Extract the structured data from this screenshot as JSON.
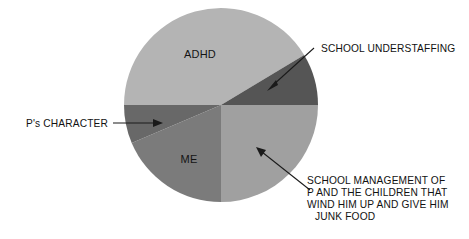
{
  "page": {
    "background_color": "#ffffff",
    "width": 469,
    "height": 239
  },
  "chart_data": {
    "type": "pie",
    "title": "",
    "subtitle": "",
    "xlabel": "",
    "ylabel": "",
    "legend_position": "none",
    "grid": false,
    "labels_placement": "inside-and-callout",
    "center": {
      "x": 221,
      "y": 105
    },
    "radius": 97,
    "start_angle_deg": 270,
    "direction": "clockwise",
    "categories": [
      "ADHD",
      "SCHOOL UNDERSTAFFING",
      "SCHOOL MANAGEMENT OF P AND THE CHILDREN THAT WIND HIM UP AND GIVE HIM JUNK FOOD",
      "ME",
      "P's CHARACTER"
    ],
    "values": [
      149,
      31,
      90,
      67,
      23
    ],
    "units": "degrees",
    "percentages": [
      41.4,
      8.6,
      25.0,
      18.6,
      6.4
    ],
    "colors": [
      "#b4b4b4",
      "#555555",
      "#a0a0a0",
      "#7b7b7b",
      "#686868"
    ],
    "slices": [
      {
        "label": "ADHD",
        "value": 149,
        "percent": 41.4,
        "color": "#b4b4b4",
        "start_deg": 270,
        "end_deg": 59,
        "label_type": "inside"
      },
      {
        "label": "SCHOOL UNDERSTAFFING",
        "value": 31,
        "percent": 8.6,
        "color": "#555555",
        "start_deg": 59,
        "end_deg": 90,
        "label_type": "callout"
      },
      {
        "label": "SCHOOL MANAGEMENT OF P AND THE CHILDREN THAT WIND HIM UP AND GIVE HIM JUNK FOOD",
        "value": 90,
        "percent": 25.0,
        "color": "#a0a0a0",
        "start_deg": 90,
        "end_deg": 180,
        "label_type": "callout"
      },
      {
        "label": "ME",
        "value": 67,
        "percent": 18.6,
        "color": "#7b7b7b",
        "start_deg": 180,
        "end_deg": 247,
        "label_type": "inside"
      },
      {
        "label": "P's CHARACTER",
        "value": 23,
        "percent": 6.4,
        "color": "#686868",
        "start_deg": 247,
        "end_deg": 270,
        "label_type": "callout"
      }
    ]
  },
  "inside_labels": {
    "adhd": "ADHD",
    "me": "ME"
  },
  "callouts": {
    "school_understaffing": {
      "text": "SCHOOL UNDERSTAFFING"
    },
    "ps_character": {
      "text": "P's CHARACTER"
    },
    "school_management": {
      "line1": "SCHOOL MANAGEMENT OF",
      "line2": "P AND THE CHILDREN THAT",
      "line3": "WIND HIM UP AND GIVE HIM",
      "line4": "JUNK FOOD"
    }
  },
  "colors": {
    "text": "#121212",
    "leader_line": "#1a1a1a",
    "slice_adhd": "#b4b4b4",
    "slice_understaffing": "#555555",
    "slice_management": "#a0a0a0",
    "slice_me": "#7b7b7b",
    "slice_character": "#686868"
  }
}
